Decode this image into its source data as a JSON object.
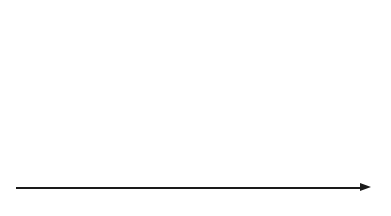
{
  "chart_data": {
    "type": "timeline",
    "title": "",
    "xlabel": "",
    "ylabel": "",
    "xlim": [
      1963,
      1984
    ],
    "axis": {
      "orientation": "horizontal",
      "arrow": true,
      "tick_years": [
        1963,
        1964,
        1965,
        1966,
        1967,
        1968,
        1969,
        1970,
        1971,
        1972,
        1973,
        1974,
        1975,
        1976,
        1977,
        1978,
        1979,
        1980,
        1981,
        1982,
        1983
      ],
      "major_tick_years": [
        1965,
        1970,
        1975,
        1980
      ],
      "tick_labels": [
        "1965",
        "1970",
        "1975",
        "1980"
      ],
      "grid": false,
      "legend": null
    },
    "events": [
      {
        "label": "DENDRAL",
        "year": 1965.3
      },
      {
        "label": "INTERNIST",
        "year": 1970.0
      },
      {
        "label": "CASNET",
        "year": 1971.4
      },
      {
        "label": "MYCIN",
        "year": 1972.1
      },
      {
        "label": "HEARSAY",
        "year": 1973.2
      },
      {
        "label": "PUFF",
        "year": 1974.9
      },
      {
        "label": "PROSPECTOR",
        "year": 1976.1
      },
      {
        "label": "TEIRESIAS",
        "year": 1978.9
      },
      {
        "label": "XCON (R1)",
        "year": 1980.0
      }
    ]
  },
  "colors": {
    "ink": "#1a1a1a",
    "background": "#ffffff"
  }
}
